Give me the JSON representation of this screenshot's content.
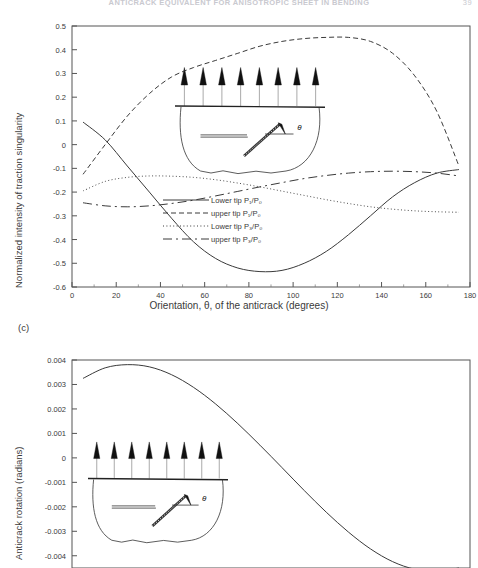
{
  "running_head": {
    "text": "ANTICRACK EQUIVALENT FOR ANISOTROPIC SHEET IN BENDING",
    "folio": "39"
  },
  "panels": [
    {
      "tag": "",
      "name": "panel-b",
      "ylabel": "Normalized intensity of traction singularity",
      "xlabel": "Orientation, θ, of the anticrack (degrees)",
      "inset": {
        "theta_symbol": "θ",
        "arrow_count": 8
      }
    },
    {
      "tag": "(c)",
      "name": "panel-c",
      "ylabel": "Anticrack rotation (radians)",
      "xlabel": "",
      "inset": {
        "theta_symbol": "θ",
        "arrow_count": 8
      }
    }
  ],
  "chart_data": [
    {
      "type": "line",
      "title": "",
      "xlabel": "Orientation, θ, of the anticrack (degrees)",
      "ylabel": "Normalized intensity of traction singularity",
      "xlim": [
        0,
        180
      ],
      "ylim": [
        -0.6,
        0.5
      ],
      "xticks": [
        0,
        20,
        40,
        60,
        80,
        100,
        120,
        140,
        160,
        180
      ],
      "xtick_labels": [
        "0",
        "20",
        "40",
        "60",
        "80",
        "100",
        "120",
        "140",
        "160",
        "180"
      ],
      "yticks": [
        -0.6,
        -0.5,
        -0.4,
        -0.3,
        -0.2,
        -0.1,
        0,
        0.1,
        0.2,
        0.3,
        0.4,
        0.5
      ],
      "ytick_labels": [
        "-0.6",
        "-0.5",
        "-0.4",
        "-0.3",
        "-0.2",
        "-0.1",
        "0",
        "0.1",
        "0.2",
        "0.3",
        "0.4",
        "0.5"
      ],
      "grid": false,
      "legend_position": "center",
      "x": [
        5,
        15,
        25,
        35,
        45,
        55,
        65,
        75,
        85,
        95,
        105,
        115,
        125,
        135,
        145,
        155,
        165,
        175
      ],
      "series": [
        {
          "name": "Lower tip  P₁/P₀",
          "style": "solid",
          "values": [
            0.095,
            0.02,
            -0.09,
            -0.2,
            -0.31,
            -0.41,
            -0.48,
            -0.52,
            -0.535,
            -0.53,
            -0.5,
            -0.45,
            -0.38,
            -0.3,
            -0.22,
            -0.16,
            -0.12,
            -0.105
          ]
        },
        {
          "name": "upper tip  P₁/P₀",
          "style": "dashed",
          "values": [
            -0.125,
            0.0,
            0.12,
            0.215,
            0.285,
            0.325,
            0.355,
            0.385,
            0.415,
            0.435,
            0.447,
            0.452,
            0.452,
            0.435,
            0.385,
            0.29,
            0.14,
            -0.09
          ]
        },
        {
          "name": "Lower tip  P₃/P₀",
          "style": "dotted",
          "values": [
            -0.195,
            -0.155,
            -0.138,
            -0.132,
            -0.133,
            -0.138,
            -0.148,
            -0.162,
            -0.178,
            -0.196,
            -0.214,
            -0.232,
            -0.248,
            -0.262,
            -0.272,
            -0.279,
            -0.283,
            -0.285
          ]
        },
        {
          "name": "upper tip  P₃/P₀",
          "style": "longdash",
          "values": [
            -0.245,
            -0.258,
            -0.262,
            -0.258,
            -0.248,
            -0.234,
            -0.216,
            -0.197,
            -0.178,
            -0.16,
            -0.143,
            -0.13,
            -0.12,
            -0.114,
            -0.112,
            -0.114,
            -0.12,
            -0.132
          ]
        }
      ]
    },
    {
      "type": "line",
      "title": "",
      "xlabel": "",
      "ylabel": "Anticrack rotation (radians)",
      "xlim": [
        0,
        180
      ],
      "ylim": [
        -0.0045,
        0.004
      ],
      "yticks": [
        -0.004,
        -0.003,
        -0.002,
        -0.001,
        0,
        0.001,
        0.002,
        0.003,
        0.004
      ],
      "ytick_labels": [
        "-0.004",
        "-0.003",
        "-0.002",
        "-0.001",
        "0",
        "0.001",
        "0.002",
        "0.003",
        "0.004"
      ],
      "grid": false,
      "x": [
        5,
        15,
        25,
        35,
        45,
        55,
        65,
        75,
        85,
        95,
        105,
        115,
        125,
        135,
        145,
        155,
        165,
        175
      ],
      "series": [
        {
          "name": "anticrack rotation",
          "style": "solid",
          "values": [
            0.00325,
            0.00368,
            0.00381,
            0.00372,
            0.0034,
            0.00288,
            0.0022,
            0.0014,
            0.00052,
            -0.0004,
            -0.00133,
            -0.00222,
            -0.00303,
            -0.00372,
            -0.00424,
            -0.00455,
            -0.00463,
            -0.0045
          ]
        }
      ]
    }
  ],
  "legend": {
    "entries": [
      {
        "label": "Lower tip  P₁/P₀",
        "style": "solid"
      },
      {
        "label": "upper tip  P₁/P₀",
        "style": "dashed"
      },
      {
        "label": "Lower tip  P₃/P₀",
        "style": "dotted"
      },
      {
        "label": "upper tip  P₃/P₀",
        "style": "longdash"
      }
    ]
  },
  "colors": {
    "ink": "#2b2b2b",
    "axis": "#555555",
    "curve": "#3a3a3a",
    "paper": "#ffffff"
  }
}
